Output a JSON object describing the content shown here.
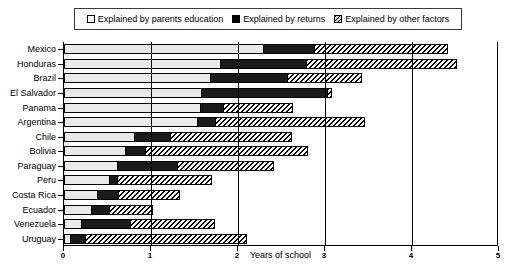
{
  "legend": {
    "items": [
      {
        "label": "Explained by parents education",
        "swatch": "white-square-icon",
        "color": "#ffffff"
      },
      {
        "label": "Explained by returns",
        "swatch": "black-square-icon",
        "color": "#000000"
      },
      {
        "label": "Explained by other factors",
        "swatch": "hatched-square-icon",
        "color": "#cccccc"
      }
    ]
  },
  "chart_data": {
    "type": "bar",
    "orientation": "horizontal",
    "stacked": true,
    "title": "",
    "xlabel": "Years of school",
    "ylabel": "",
    "xlim": [
      0,
      5
    ],
    "xticks": [
      0,
      1,
      2,
      3,
      4,
      5
    ],
    "xtick_labels": [
      "0",
      "1",
      "2",
      "3",
      "4",
      "5"
    ],
    "grid": true,
    "legend_position": "top",
    "categories": [
      "Mexico",
      "Honduras",
      "Brazil",
      "El Salvador",
      "Panama",
      "Argentina",
      "Chile",
      "Bolivia",
      "Paraguay",
      "Peru",
      "Costa Rica",
      "Ecuador",
      "Venezuela",
      "Uruguay"
    ],
    "series": [
      {
        "name": "Explained by parents education",
        "values": [
          2.3,
          1.8,
          1.69,
          1.59,
          1.57,
          1.54,
          0.82,
          0.71,
          0.62,
          0.53,
          0.39,
          0.32,
          0.21,
          0.08
        ]
      },
      {
        "name": "Explained by returns",
        "values": [
          0.58,
          0.99,
          0.89,
          1.44,
          0.27,
          0.21,
          0.41,
          0.23,
          0.69,
          0.09,
          0.24,
          0.21,
          0.56,
          0.17
        ]
      },
      {
        "name": "Explained by other factors",
        "values": [
          1.53,
          1.73,
          0.85,
          0.05,
          0.79,
          1.71,
          1.39,
          1.87,
          1.1,
          1.08,
          0.7,
          0.49,
          0.96,
          1.85
        ]
      }
    ],
    "totals": [
      4.41,
      4.52,
      3.43,
      3.08,
      2.63,
      3.46,
      2.62,
      2.81,
      2.41,
      1.7,
      1.33,
      1.02,
      1.73,
      2.1
    ]
  }
}
